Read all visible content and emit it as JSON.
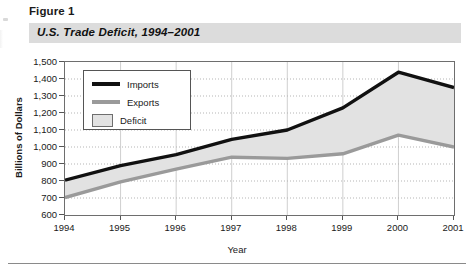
{
  "figure": {
    "label": "Figure 1",
    "title": "U.S. Trade Deficit, 1994–2001"
  },
  "chart_data": {
    "type": "area",
    "title": "U.S. Trade Deficit, 1994–2001",
    "xlabel": "Year",
    "ylabel": "Billions of Dollars",
    "categories": [
      "1994",
      "1995",
      "1996",
      "1997",
      "1998",
      "1999",
      "2000",
      "2001"
    ],
    "x": [
      1994,
      1995,
      1996,
      1997,
      1998,
      1999,
      2000,
      2001
    ],
    "ylim": [
      600,
      1500
    ],
    "yticks": [
      "600",
      "700",
      "800",
      "900",
      "1,000",
      "1,100",
      "1,200",
      "1,300",
      "1,400",
      "1,500"
    ],
    "ytick_values": [
      600,
      700,
      800,
      900,
      1000,
      1100,
      1200,
      1300,
      1400,
      1500
    ],
    "grid": "horizontal-dotted-and-vertical-solid",
    "legend_position": "top-left-inside",
    "series": [
      {
        "name": "Imports",
        "color": "#111111",
        "style": "line",
        "values": [
          805,
          890,
          955,
          1045,
          1100,
          1230,
          1440,
          1350
        ]
      },
      {
        "name": "Exports",
        "color": "#9a9a9a",
        "style": "line",
        "values": [
          703,
          795,
          870,
          940,
          933,
          960,
          1070,
          1000
        ]
      },
      {
        "name": "Deficit",
        "color": "#e2e2e2",
        "style": "area-between",
        "values": [
          102,
          95,
          85,
          105,
          167,
          270,
          370,
          350
        ]
      }
    ],
    "legend": [
      {
        "label": "Imports",
        "swatch": "black-line"
      },
      {
        "label": "Exports",
        "swatch": "gray-line"
      },
      {
        "label": "Deficit",
        "swatch": "gray-box"
      }
    ]
  },
  "colors": {
    "imports_line": "#111111",
    "exports_line": "#9a9a9a",
    "deficit_fill": "#e2e2e2",
    "title_band": "#dcdcdc",
    "axis": "#6e6e6e"
  }
}
